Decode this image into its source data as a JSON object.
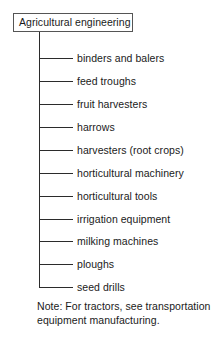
{
  "diagram": {
    "type": "tree",
    "root": {
      "label": "Agricultural engineering",
      "box": {
        "x": 13,
        "y": 13,
        "width": 120,
        "height": 19
      }
    },
    "trunk": {
      "x": 39,
      "top": 32,
      "bottom": 287,
      "connector_end_x": 73,
      "label_x": 77
    },
    "line_color": "#2b2b2b",
    "border_color": "#555555",
    "background_color": "#ffffff",
    "text_color": "#1a1a1a",
    "items": [
      {
        "label": "binders and balers",
        "y": 58
      },
      {
        "label": "feed troughs",
        "y": 81
      },
      {
        "label": "fruit harvesters",
        "y": 104
      },
      {
        "label": "harrows",
        "y": 127
      },
      {
        "label": "harvesters (root crops)",
        "y": 150
      },
      {
        "label": "horticultural machinery",
        "y": 173
      },
      {
        "label": "horticultural tools",
        "y": 196
      },
      {
        "label": "irrigation equipment",
        "y": 219
      },
      {
        "label": "milking machines",
        "y": 241
      },
      {
        "label": "ploughs",
        "y": 264
      },
      {
        "label": "seed drills",
        "y": 287
      }
    ],
    "note": {
      "line1": "Note: For tractors, see transportation",
      "line2": "equipment manufacturing."
    }
  }
}
